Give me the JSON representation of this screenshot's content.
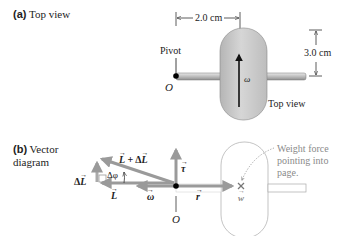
{
  "panel_a": {
    "label_prefix": "(a)",
    "label_text": "Top view",
    "width_dimension": "2.0 cm",
    "height_dimension": "3.0 cm",
    "pivot_label": "Pivot",
    "origin_label": "O",
    "omega_label": "ω",
    "view_caption": "Top view"
  },
  "panel_b": {
    "label_prefix": "(b)",
    "label_line1": "Vector",
    "label_line2": "diagram",
    "L_plus_dL": "L + ΔL",
    "L_sum_parts": {
      "L": "L",
      "plus": " + Δ",
      "dL": "L"
    },
    "dL_prefix": "Δ",
    "dL_symbol": "L",
    "dphi": "Δφ",
    "L_label": "L",
    "omega_label": "ω",
    "tau_label": "τ",
    "r_label": "r",
    "w_label": "w",
    "origin_label": "O",
    "weight_note_lines": [
      "Weight force",
      "pointing into",
      "page."
    ]
  },
  "colors": {
    "wheel_fill": "#c8c8c8",
    "vector_gray": "#9a9a9a",
    "annotation_gray": "#8a8a8a",
    "ink": "#111111"
  }
}
